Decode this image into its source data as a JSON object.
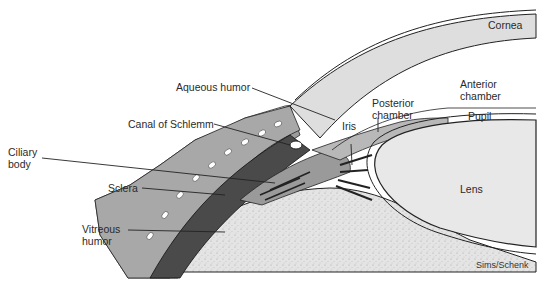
{
  "figure": {
    "colors": {
      "background": "#ffffff",
      "cornea": "#dcdcdc",
      "sclera": "#4a4a4a",
      "conjunctiva": "#9a9a9a",
      "vitreous": "#e2e2e2",
      "lens": "#e6e6e6",
      "outline": "#222222"
    },
    "labels": {
      "cornea": "Cornea",
      "aqueous_humor": "Aqueous humor",
      "canal_of_schlemm": "Canal of Schlemm",
      "anterior_chamber": "Anterior\nchamber",
      "posterior_chamber": "Posterior\nchamber",
      "iris": "Iris",
      "pupil": "Pupil",
      "ciliary_body": "Ciliary\nbody",
      "sclera": "Sclera",
      "lens": "Lens",
      "vitreous_humor": "Vitreous\nhumor"
    },
    "credit": "Sims/Schenk"
  }
}
